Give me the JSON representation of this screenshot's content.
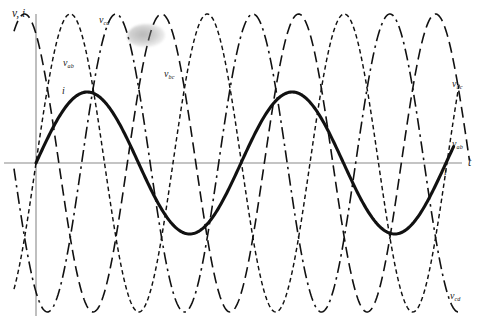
{
  "figure": {
    "background_color": "#ffffff",
    "ink_color": "#111111",
    "axis_color": "#8a8a8a"
  },
  "axes": {
    "y_label": "v, i",
    "x_label": "t",
    "origin_x_px": 36,
    "origin_y_px": 163,
    "x_axis_start_px": 4,
    "x_axis_end_px": 462,
    "y_axis_top_px": 14,
    "y_axis_bottom_px": 316
  },
  "labels": {
    "axis_y": "v, i",
    "axis_x": "t",
    "current_left": "i",
    "current_right": "i",
    "v_ab_left_base": "v",
    "v_ab_left_sub": "ab",
    "v_cd_top_base": "v",
    "v_cd_top_sub": "cd",
    "v_bc_mid_base": "v",
    "v_bc_mid_sub": "bc",
    "v_bc_right_base": "v",
    "v_bc_right_sub": "bc",
    "v_ab_right_base": "v",
    "v_ab_right_sub": "ab",
    "v_cd_bottom_base": "v",
    "v_cd_bottom_sub": "cd"
  },
  "artifact": {
    "name": "scan-smudge",
    "x_px": 127,
    "y_px": 24,
    "width_px": 38,
    "height_px": 23
  },
  "chart_data": {
    "type": "line",
    "xlabel": "t",
    "ylabel": "v, i",
    "grid": false,
    "legend": "inline-annotations",
    "xlim": [
      0,
      1.0
    ],
    "ylim": [
      -1.15,
      1.15
    ],
    "x_axis_at_y": 0,
    "y_axis_at_x": 0,
    "series": [
      {
        "name": "i",
        "label": "i",
        "style": "solid-thick",
        "amplitude": 0.52,
        "period_px": 205,
        "phase_deg": 0,
        "peaks_px": [
          {
            "x": 73,
            "y": 92
          },
          {
            "x": 278,
            "y": 92
          },
          {
            "x": 383,
            "y": 92
          }
        ],
        "troughs_px": [
          {
            "x": 175,
            "y": 234
          },
          {
            "x": 278,
            "y": 234
          }
        ]
      },
      {
        "name": "v_ab",
        "label": "vab",
        "style": "fine-short-dash",
        "amplitude": 1.0,
        "period_px": 137,
        "phase_deg": 0,
        "rectified": true
      },
      {
        "name": "v_bc",
        "label": "vbc",
        "style": "long-dash",
        "amplitude": 1.0,
        "period_px": 137,
        "phase_deg": 120,
        "rectified": true
      },
      {
        "name": "v_cd",
        "label": "vcd",
        "style": "dash-dot",
        "amplitude": 1.0,
        "period_px": 137,
        "phase_deg": 240,
        "rectified": true
      }
    ]
  }
}
